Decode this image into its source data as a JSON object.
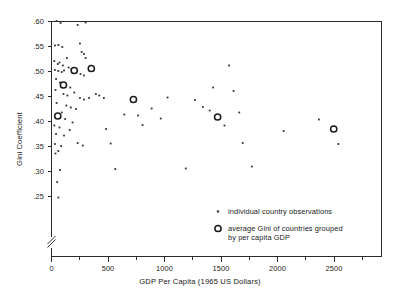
{
  "chart_data": {
    "type": "scatter",
    "title": "",
    "xlabel": "GDP Per Capita (1965 US Dollars)",
    "ylabel": "Gini Coefficient",
    "xlim": [
      0,
      2900
    ],
    "ylim": [
      0.2,
      0.6
    ],
    "grid": false,
    "axis_break": "y-axis broken below .25",
    "x_ticks": [
      0,
      500,
      1000,
      1500,
      2000,
      2500
    ],
    "x_tick_labels": [
      "0",
      "500",
      "1000",
      "1500",
      "2000",
      "2500"
    ],
    "x_minor_ticks": [
      250,
      750,
      1250,
      1750,
      2250,
      2750
    ],
    "y_ticks": [
      0.25,
      0.3,
      0.35,
      0.4,
      0.45,
      0.5,
      0.55,
      0.6
    ],
    "y_tick_labels": [
      ".25",
      ".30",
      ".35",
      ".40",
      ".45",
      ".50",
      ".55",
      ".60"
    ],
    "legend_position": "lower-right inside axes",
    "series": [
      {
        "name": "individual country observations",
        "marker": "small-dot",
        "points": [
          [
            45,
            0.601
          ],
          [
            80,
            0.597
          ],
          [
            300,
            0.598
          ],
          [
            230,
            0.593
          ],
          [
            30,
            0.552
          ],
          [
            60,
            0.553
          ],
          [
            95,
            0.549
          ],
          [
            250,
            0.556
          ],
          [
            265,
            0.539
          ],
          [
            285,
            0.535
          ],
          [
            300,
            0.527
          ],
          [
            25,
            0.521
          ],
          [
            55,
            0.515
          ],
          [
            70,
            0.518
          ],
          [
            100,
            0.512
          ],
          [
            135,
            0.527
          ],
          [
            150,
            0.508
          ],
          [
            175,
            0.505
          ],
          [
            30,
            0.503
          ],
          [
            60,
            0.501
          ],
          [
            90,
            0.499
          ],
          [
            110,
            0.502
          ],
          [
            225,
            0.503
          ],
          [
            255,
            0.495
          ],
          [
            285,
            0.492
          ],
          [
            40,
            0.485
          ],
          [
            75,
            0.478
          ],
          [
            120,
            0.473
          ],
          [
            165,
            0.468
          ],
          [
            35,
            0.463
          ],
          [
            105,
            0.455
          ],
          [
            140,
            0.452
          ],
          [
            200,
            0.458
          ],
          [
            250,
            0.447
          ],
          [
            285,
            0.444
          ],
          [
            330,
            0.447
          ],
          [
            390,
            0.455
          ],
          [
            420,
            0.452
          ],
          [
            460,
            0.447
          ],
          [
            45,
            0.437
          ],
          [
            130,
            0.432
          ],
          [
            170,
            0.428
          ],
          [
            215,
            0.425
          ],
          [
            90,
            0.418
          ],
          [
            55,
            0.411
          ],
          [
            120,
            0.405
          ],
          [
            185,
            0.398
          ],
          [
            25,
            0.392
          ],
          [
            70,
            0.388
          ],
          [
            160,
            0.383
          ],
          [
            40,
            0.375
          ],
          [
            110,
            0.372
          ],
          [
            30,
            0.355
          ],
          [
            85,
            0.351
          ],
          [
            230,
            0.357
          ],
          [
            275,
            0.352
          ],
          [
            60,
            0.341
          ],
          [
            35,
            0.336
          ],
          [
            75,
            0.303
          ],
          [
            50,
            0.279
          ],
          [
            60,
            0.248
          ],
          [
            480,
            0.385
          ],
          [
            520,
            0.356
          ],
          [
            560,
            0.305
          ],
          [
            640,
            0.414
          ],
          [
            700,
            0.441
          ],
          [
            760,
            0.412
          ],
          [
            800,
            0.393
          ],
          [
            880,
            0.426
          ],
          [
            960,
            0.406
          ],
          [
            1020,
            0.448
          ],
          [
            1180,
            0.306
          ],
          [
            1260,
            0.443
          ],
          [
            1330,
            0.429
          ],
          [
            1390,
            0.422
          ],
          [
            1420,
            0.468
          ],
          [
            1520,
            0.392
          ],
          [
            1560,
            0.512
          ],
          [
            1600,
            0.461
          ],
          [
            1650,
            0.418
          ],
          [
            1680,
            0.357
          ],
          [
            1760,
            0.31
          ],
          [
            2040,
            0.381
          ],
          [
            2350,
            0.404
          ],
          [
            2520,
            0.355
          ]
        ]
      },
      {
        "name": "average Gini of countries grouped by per capita GDP",
        "marker": "open-circle",
        "points": [
          [
            55,
            0.411
          ],
          [
            105,
            0.473
          ],
          [
            200,
            0.502
          ],
          [
            350,
            0.506
          ],
          [
            720,
            0.444
          ],
          [
            1460,
            0.409
          ],
          [
            2480,
            0.385
          ]
        ]
      }
    ],
    "legend": [
      {
        "marker": "small-dot",
        "label": "individual country observations"
      },
      {
        "marker": "open-circle",
        "label_line1": "average Gini of countries grouped",
        "label_line2": "by per capita GDP"
      }
    ]
  },
  "colors": {
    "axis": "#2b2b2b",
    "dot": "#333333",
    "circle_stroke": "#1a1a1a",
    "background": "#ffffff"
  }
}
